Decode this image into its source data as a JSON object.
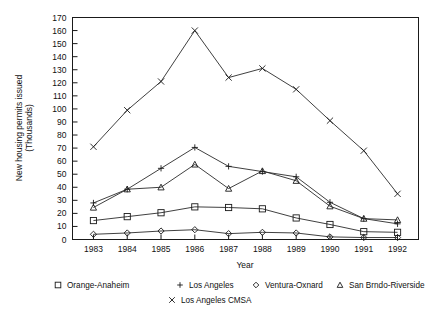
{
  "chart_data": {
    "type": "line",
    "title": "",
    "xlabel": "Year",
    "ylabel": "New housing permits issued (Thousands)",
    "x": [
      1983,
      1984,
      1985,
      1986,
      1987,
      1988,
      1989,
      1990,
      1991,
      1992
    ],
    "xtick_labels": [
      "1983",
      "1984",
      "1985",
      "1986",
      "1987",
      "1988",
      "1989",
      "1990",
      "1991",
      "1992"
    ],
    "ytick_labels": [
      "0",
      "10",
      "20",
      "30",
      "40",
      "50",
      "60",
      "70",
      "80",
      "90",
      "100",
      "110",
      "120",
      "130",
      "140",
      "150",
      "160",
      "170"
    ],
    "ylim": [
      0,
      170
    ],
    "ytick_step": 10,
    "grid": false,
    "legend_position": "bottom",
    "series": [
      {
        "name": "Orange-Anaheim",
        "marker": "square",
        "values": [
          14.5,
          17.5,
          20.5,
          25,
          24.5,
          23.5,
          16.5,
          11.5,
          6,
          5.5
        ]
      },
      {
        "name": "Los Angeles",
        "marker": "plus",
        "values": [
          28,
          38.5,
          54.5,
          70.5,
          56,
          52,
          48,
          28.5,
          16,
          12
        ]
      },
      {
        "name": "Ventura-Oxnard",
        "marker": "diamond",
        "values": [
          4,
          5,
          6.5,
          7.5,
          4.5,
          5.5,
          5,
          2,
          1.5,
          1.5
        ]
      },
      {
        "name": "San Brndo-Riverside",
        "marker": "triangle",
        "values": [
          24.5,
          38.5,
          40,
          57.5,
          39,
          52.5,
          45,
          25.5,
          16,
          15
        ]
      },
      {
        "name": "Los Angeles CMSA",
        "marker": "cross",
        "values": [
          71,
          99,
          121,
          160,
          124,
          131,
          115,
          91,
          68,
          35
        ]
      }
    ]
  },
  "legend": {
    "row1": [
      {
        "label": "Orange-Anaheim",
        "marker": "square"
      },
      {
        "label": "Los Angeles",
        "marker": "plus"
      },
      {
        "label": "Ventura-Oxnard",
        "marker": "diamond"
      },
      {
        "label": "San Brndo-Riverside",
        "marker": "triangle"
      }
    ],
    "row2": [
      {
        "label": "Los Angeles CMSA",
        "marker": "cross"
      }
    ]
  },
  "colors": {
    "ink": "#1a1a1a",
    "line": "#2a2a2a",
    "background": "#ffffff"
  }
}
